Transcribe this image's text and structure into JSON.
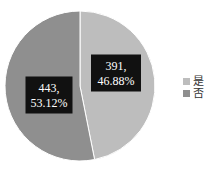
{
  "chart_data": {
    "type": "pie",
    "title": "",
    "start_angle_deg": 0,
    "direction": "clockwise",
    "legend_position": "right",
    "slices": [
      {
        "label": "是",
        "value": 391,
        "percent": "46.88%",
        "data_label_line1": "391,",
        "data_label_line2": "46.88%",
        "color": "#bdbdbd"
      },
      {
        "label": "否",
        "value": 443,
        "percent": "53.12%",
        "data_label_line1": "443,",
        "data_label_line2": "53.12%",
        "color": "#8f8f8f"
      }
    ],
    "data_label_background": "#111111",
    "data_label_color": "#ffffff"
  }
}
